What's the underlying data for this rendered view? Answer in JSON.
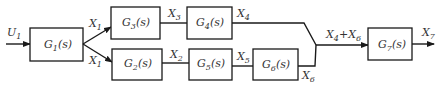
{
  "diagram": {
    "type": "block-diagram",
    "input": {
      "label": "U",
      "sub": "1"
    },
    "blocks": [
      {
        "id": "G1",
        "name": "G",
        "sub": "1",
        "arg": "(s)"
      },
      {
        "id": "G3",
        "name": "G",
        "sub": "3",
        "arg": "(s)"
      },
      {
        "id": "G4",
        "name": "G",
        "sub": "4",
        "arg": "(s)"
      },
      {
        "id": "G2",
        "name": "G",
        "sub": "2",
        "arg": "(s)"
      },
      {
        "id": "G5",
        "name": "G",
        "sub": "5",
        "arg": "(s)"
      },
      {
        "id": "G6",
        "name": "G",
        "sub": "6",
        "arg": "(s)"
      },
      {
        "id": "G7",
        "name": "G",
        "sub": "7",
        "arg": "(s)"
      }
    ],
    "signals": {
      "x1_top": {
        "label": "X",
        "sub": "1"
      },
      "x1_bottom": {
        "label": "X",
        "sub": "1"
      },
      "x3": {
        "label": "X",
        "sub": "3"
      },
      "x4": {
        "label": "X",
        "sub": "4"
      },
      "x2": {
        "label": "X",
        "sub": "2"
      },
      "x5": {
        "label": "X",
        "sub": "5"
      },
      "x6": {
        "label": "X",
        "sub": "6"
      },
      "sum": {
        "a": "X",
        "a_sub": "4",
        "plus": "+",
        "b": "X",
        "b_sub": "6"
      },
      "x7": {
        "label": "X",
        "sub": "7"
      }
    },
    "colors": {
      "stroke": "#1a1a1a",
      "text": "#333333",
      "background": "#ffffff"
    }
  }
}
